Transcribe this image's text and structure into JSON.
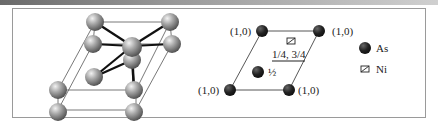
{
  "figure": {
    "left_panel": {
      "description": "3D unit cell of NiAs structure",
      "atom_color": "#9a9a9a"
    },
    "right_panel": {
      "corner_labels": [
        "(1,0)",
        "(1,0)",
        "(1,0)",
        "(1,0)"
      ],
      "center_label": "½",
      "ni_label": "1/4, 3/4"
    },
    "legend": {
      "items": [
        {
          "symbol": "filled-circle",
          "label": "As"
        },
        {
          "symbol": "square",
          "label": "Ni"
        }
      ]
    }
  }
}
